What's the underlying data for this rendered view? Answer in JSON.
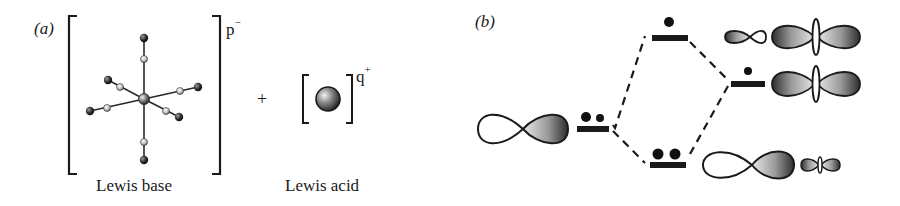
{
  "panel_a": {
    "label": "(a)",
    "base_caption": "Lewis base",
    "base_charge": "p",
    "base_charge_sign": "−",
    "plus_sign": "+",
    "acid_caption": "Lewis acid",
    "acid_charge": "q",
    "acid_charge_sign": "+"
  },
  "panel_b": {
    "label": "(b)",
    "energy_levels": [
      {
        "name": "lewis-base-orbital",
        "electrons": 2
      },
      {
        "name": "antibonding-mo",
        "electrons": 1
      },
      {
        "name": "lewis-acid-orbital",
        "electrons": 1
      },
      {
        "name": "bonding-mo",
        "electrons": 2
      }
    ]
  }
}
